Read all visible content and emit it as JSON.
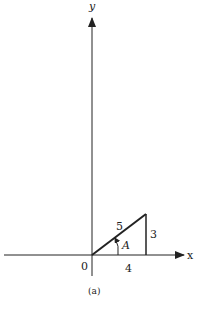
{
  "diagram": {
    "axes": {
      "x_label": "x",
      "y_label": "y",
      "origin_label": "0"
    },
    "triangle": {
      "hypotenuse_label": "5",
      "opposite_label": "3",
      "adjacent_label": "4",
      "angle_label": "A"
    },
    "caption": "(a)",
    "colors": {
      "stroke": "#222222",
      "background": "#ffffff"
    }
  }
}
